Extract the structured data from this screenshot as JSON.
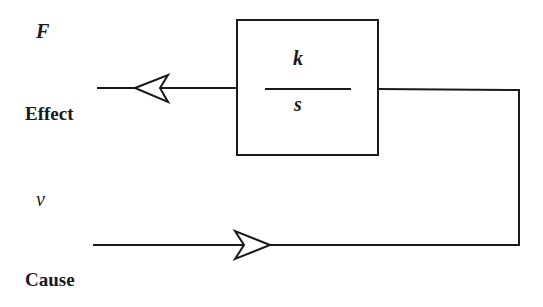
{
  "diagram": {
    "type": "block-diagram",
    "colors": {
      "stroke": "#1a1a1a",
      "background": "#ffffff"
    },
    "block": {
      "numerator": "k",
      "denominator": "s"
    },
    "output_signal": {
      "symbol": "F",
      "label": "Effect"
    },
    "input_signal": {
      "symbol": "v",
      "label": "Cause"
    }
  }
}
